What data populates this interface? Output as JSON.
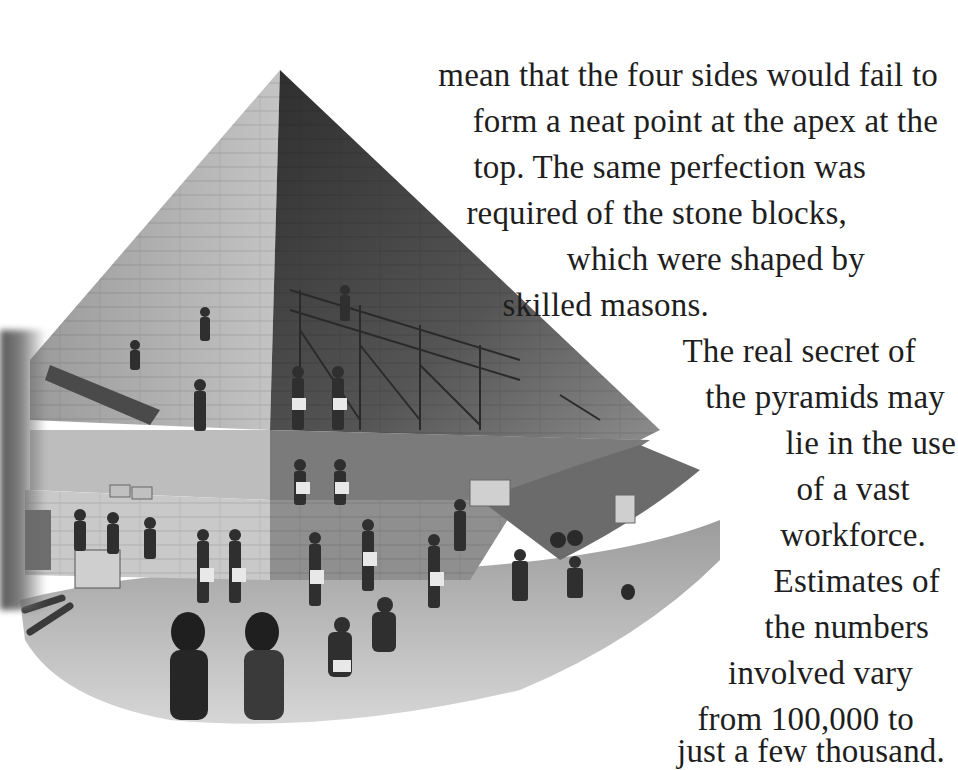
{
  "page": {
    "type": "scanned book page",
    "palette": {
      "paper": "#ffffff",
      "ink": "#1e1e1e",
      "stone_light": "#b9b9b9",
      "stone_mid": "#8a8a8a",
      "stone_dark": "#3e3e3e",
      "ground": "#a8a8a8"
    }
  },
  "illustration": {
    "subject": "Workers constructing a stone pyramid with scaffolding, ramps and sledges",
    "style": "grayscale painted illustration"
  },
  "body_text": {
    "lines": [
      "mean that the four sides would fail to",
      "form a neat point at the apex at the",
      "top. The same perfection was",
      "required of the stone blocks,",
      "which were shaped by",
      "skilled masons.",
      "The real secret of",
      "the pyramids may",
      "lie in the use",
      "of a vast",
      "workforce.",
      "Estimates of",
      "the numbers",
      "involved vary",
      "from 100,000 to",
      "just a few thousand."
    ]
  }
}
